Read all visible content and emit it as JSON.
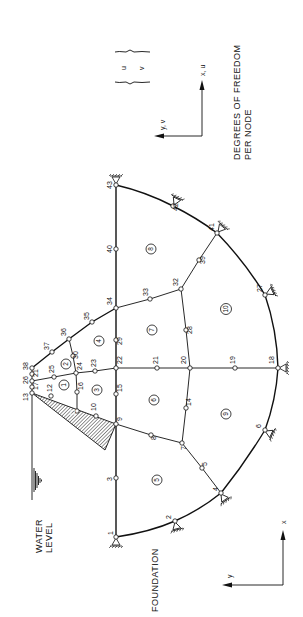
{
  "diagram": {
    "title_lines": [
      "DEGREES OF FREEDOM",
      "PER NODE"
    ],
    "dof_vector": [
      "u",
      "v"
    ],
    "dof_axes": {
      "x_label": "x, u",
      "y_label": "y, v"
    },
    "global_axes": {
      "x_label": "x",
      "y_label": "y"
    },
    "water_level_lines": [
      "WATER",
      "LEVEL"
    ],
    "foundation_label": "FOUNDATION",
    "accent_color": "#111111",
    "nodes": [
      {
        "id": "1",
        "x": 116,
        "y": 537
      },
      {
        "id": "2",
        "x": 175,
        "y": 521
      },
      {
        "id": "3",
        "x": 116,
        "y": 478
      },
      {
        "id": "4",
        "x": 221,
        "y": 493
      },
      {
        "id": "5",
        "x": 202,
        "y": 468
      },
      {
        "id": "6",
        "x": 265,
        "y": 430
      },
      {
        "id": "7",
        "x": 182,
        "y": 443
      },
      {
        "id": "8",
        "x": 151,
        "y": 435
      },
      {
        "id": "9",
        "x": 116,
        "y": 424
      },
      {
        "id": "10",
        "x": 96,
        "y": 416
      },
      {
        "id": "11",
        "x": 77,
        "y": 411
      },
      {
        "id": "12",
        "x": 51,
        "y": 396
      },
      {
        "id": "13",
        "x": 32,
        "y": 393
      },
      {
        "id": "14",
        "x": 186,
        "y": 408
      },
      {
        "id": "15",
        "x": 116,
        "y": 394
      },
      {
        "id": "16",
        "x": 77,
        "y": 392
      },
      {
        "id": "17",
        "x": 32,
        "y": 387
      },
      {
        "id": "18",
        "x": 278,
        "y": 368
      },
      {
        "id": "19",
        "x": 235,
        "y": 368
      },
      {
        "id": "20",
        "x": 190,
        "y": 368
      },
      {
        "id": "21",
        "x": 157,
        "y": 368
      },
      {
        "id": "22",
        "x": 116,
        "y": 368
      },
      {
        "id": "23",
        "x": 95,
        "y": 371
      },
      {
        "id": "24",
        "x": 76,
        "y": 373
      },
      {
        "id": "25",
        "x": 54,
        "y": 377
      },
      {
        "id": "26",
        "x": 32,
        "y": 381
      },
      {
        "id": "27",
        "x": 265,
        "y": 295
      },
      {
        "id": "28",
        "x": 186,
        "y": 330
      },
      {
        "id": "29",
        "x": 116,
        "y": 340
      },
      {
        "id": "30",
        "x": 73,
        "y": 356
      },
      {
        "id": "32",
        "x": 181,
        "y": 289
      },
      {
        "id": "33",
        "x": 150,
        "y": 299
      },
      {
        "id": "34",
        "x": 116,
        "y": 308
      },
      {
        "id": "35",
        "x": 92,
        "y": 322
      },
      {
        "id": "36",
        "x": 69,
        "y": 339
      },
      {
        "id": "37",
        "x": 52,
        "y": 352
      },
      {
        "id": "38",
        "x": 32,
        "y": 368
      },
      {
        "id": "39",
        "x": 199,
        "y": 260
      },
      {
        "id": "40",
        "x": 116,
        "y": 249
      },
      {
        "id": "41",
        "x": 217,
        "y": 233
      },
      {
        "id": "42",
        "x": 173,
        "y": 206
      },
      {
        "id": "43",
        "x": 116,
        "y": 185
      }
    ],
    "node_21b": {
      "id": "21",
      "x": 32,
      "y": 374
    },
    "elements": [
      {
        "id": "1",
        "x": 64,
        "y": 385
      },
      {
        "id": "2",
        "x": 66,
        "y": 364
      },
      {
        "id": "3",
        "x": 97,
        "y": 390
      },
      {
        "id": "4",
        "x": 99,
        "y": 341
      },
      {
        "id": "5",
        "x": 157,
        "y": 480
      },
      {
        "id": "6",
        "x": 154,
        "y": 400
      },
      {
        "id": "7",
        "x": 152,
        "y": 330
      },
      {
        "id": "8",
        "x": 151,
        "y": 249
      },
      {
        "id": "9",
        "x": 226,
        "y": 414
      },
      {
        "id": "10",
        "x": 226,
        "y": 309
      },
      {
        "id": "11",
        "x": 76,
        "y": 420
      }
    ],
    "supports": [
      "1",
      "2",
      "4",
      "6",
      "18",
      "27",
      "41",
      "42",
      "43"
    ]
  }
}
